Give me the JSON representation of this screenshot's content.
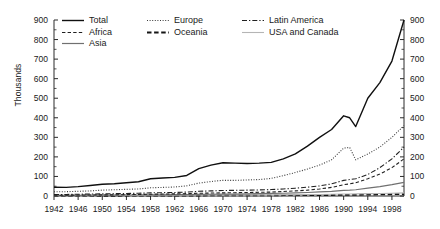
{
  "chart_data": {
    "type": "line",
    "title": "",
    "xlabel": "",
    "ylabel": "Thousands",
    "xlim": [
      1942,
      2000
    ],
    "ylim": [
      0,
      900
    ],
    "ytick_step": 100,
    "xtick_step": 4,
    "grid": false,
    "legend_position": "top-left",
    "dual_y_axis": true,
    "yticks": [
      0,
      100,
      200,
      300,
      400,
      500,
      600,
      700,
      800,
      900
    ],
    "xticks": [
      1942,
      1946,
      1950,
      1954,
      1958,
      1962,
      1966,
      1970,
      1974,
      1978,
      1982,
      1986,
      1990,
      1994,
      1998
    ],
    "x": [
      1942,
      1944,
      1946,
      1948,
      1950,
      1952,
      1954,
      1956,
      1958,
      1960,
      1962,
      1964,
      1966,
      1968,
      1970,
      1972,
      1974,
      1976,
      1978,
      1980,
      1982,
      1984,
      1986,
      1988,
      1990,
      1991,
      1992,
      1994,
      1996,
      1998,
      2000
    ],
    "series": [
      {
        "name": "Total",
        "style": "solid",
        "color": "#101010",
        "width": 1.4,
        "values": [
          45,
          44,
          48,
          54,
          60,
          63,
          68,
          73,
          88,
          92,
          95,
          105,
          140,
          158,
          170,
          168,
          166,
          168,
          172,
          190,
          215,
          255,
          300,
          340,
          410,
          400,
          355,
          500,
          580,
          690,
          900
        ]
      },
      {
        "name": "Europe",
        "style": "dotted",
        "color": "#3a3a3a",
        "width": 1.1,
        "values": [
          22,
          22,
          24,
          26,
          30,
          32,
          34,
          36,
          42,
          44,
          46,
          52,
          66,
          74,
          80,
          80,
          82,
          84,
          90,
          104,
          120,
          138,
          158,
          185,
          245,
          248,
          185,
          215,
          250,
          300,
          360
        ]
      },
      {
        "name": "Latin America",
        "style": "dashdot",
        "color": "#202020",
        "width": 1.1,
        "values": [
          8,
          8,
          9,
          10,
          11,
          12,
          13,
          14,
          16,
          17,
          18,
          20,
          24,
          26,
          28,
          29,
          30,
          31,
          33,
          36,
          40,
          45,
          52,
          62,
          80,
          84,
          88,
          110,
          145,
          190,
          250
        ]
      },
      {
        "name": "Africa",
        "style": "dashed",
        "color": "#202020",
        "width": 1.1,
        "values": [
          4,
          4,
          5,
          5,
          6,
          6,
          7,
          8,
          9,
          10,
          11,
          12,
          14,
          15,
          16,
          17,
          18,
          19,
          20,
          23,
          26,
          30,
          36,
          44,
          58,
          62,
          68,
          88,
          112,
          145,
          190
        ]
      },
      {
        "name": "Asia",
        "style": "solid",
        "color": "#707070",
        "width": 1.2,
        "values": [
          3,
          3,
          3,
          4,
          4,
          4,
          5,
          5,
          6,
          6,
          7,
          7,
          8,
          9,
          10,
          10,
          11,
          12,
          13,
          14,
          16,
          18,
          21,
          24,
          29,
          30,
          32,
          40,
          48,
          58,
          70
        ]
      },
      {
        "name": "USA and Canada",
        "style": "solid",
        "color": "#b5b5b5",
        "width": 1.1,
        "values": [
          2,
          2,
          2,
          2,
          3,
          3,
          3,
          3,
          4,
          4,
          4,
          4,
          5,
          5,
          5,
          5,
          6,
          6,
          6,
          7,
          7,
          8,
          8,
          9,
          10,
          10,
          11,
          12,
          13,
          14,
          16
        ]
      },
      {
        "name": "Oceania",
        "style": "thickdash",
        "color": "#151515",
        "width": 1.8,
        "values": [
          1,
          1,
          1,
          1,
          1,
          1,
          2,
          2,
          2,
          2,
          2,
          2,
          2,
          3,
          3,
          3,
          3,
          3,
          3,
          4,
          4,
          4,
          5,
          5,
          6,
          6,
          6,
          7,
          8,
          9,
          10
        ]
      }
    ]
  },
  "legend": {
    "rows": [
      [
        {
          "label": "Total",
          "key": "total"
        },
        {
          "label": "Europe",
          "key": "europe"
        },
        {
          "label": "Latin America",
          "key": "latin-america"
        }
      ],
      [
        {
          "label": "Africa",
          "key": "africa"
        },
        {
          "label": "Oceania",
          "key": "oceania"
        },
        {
          "label": "USA and Canada",
          "key": "usa-and-canada"
        }
      ],
      [
        {
          "label": "Asia",
          "key": "asia"
        }
      ]
    ]
  }
}
